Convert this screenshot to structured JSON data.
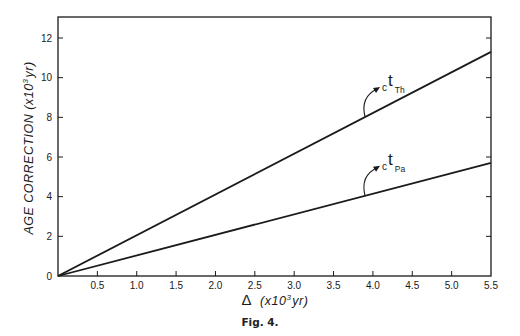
{
  "chart_data": {
    "type": "line",
    "title": "",
    "caption": "Fig. 4.",
    "xlabel": "Δ (x10³ yr)",
    "xlabel_parts": {
      "symbol": "Δ",
      "unit_pre": "(x10",
      "sup": "3",
      "unit_post": "yr)"
    },
    "ylabel": "AGE CORRECTION (x10³ yr)",
    "ylabel_parts": {
      "main": "AGE CORRECTION (x10",
      "sup": "3",
      "post": "yr)"
    },
    "xlim": [
      0,
      5.5
    ],
    "ylim": [
      0,
      13
    ],
    "x_ticks": [
      0.5,
      1.0,
      1.5,
      2.0,
      2.5,
      3.0,
      3.5,
      4.0,
      4.5,
      5.0,
      5.5
    ],
    "x_tick_labels": [
      "0.5",
      "1.0",
      "1.5",
      "2.0",
      "2.5",
      "3.0",
      "3.5",
      "4.0",
      "4.5",
      "5.0",
      "5.5"
    ],
    "y_ticks": [
      0,
      2,
      4,
      6,
      8,
      10,
      12
    ],
    "y_tick_labels": [
      "0",
      "2",
      "4",
      "6",
      "8",
      "10",
      "12"
    ],
    "grid": false,
    "legend": "inline annotations with arrows",
    "series": [
      {
        "name": "ct_Th",
        "label_base": "c",
        "label_main": "t",
        "label_sub": "Th",
        "x": [
          0,
          5.5
        ],
        "y": [
          0,
          11.3
        ],
        "annotation_at_x": 3.9
      },
      {
        "name": "ct_Pa",
        "label_base": "c",
        "label_main": "t",
        "label_sub": "Pa",
        "x": [
          0,
          5.5
        ],
        "y": [
          0,
          5.7
        ],
        "annotation_at_x": 3.9
      }
    ]
  }
}
